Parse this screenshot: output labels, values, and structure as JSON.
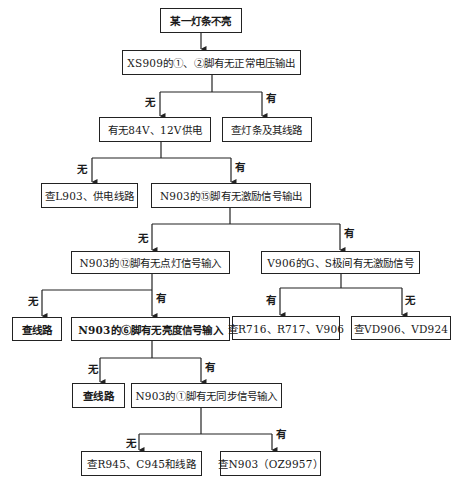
{
  "diagram": {
    "type": "flowchart",
    "nodes": [
      {
        "id": "n1",
        "text": "某一灯条不亮"
      },
      {
        "id": "n2",
        "text": "XS909的①、②脚有无正常电压输出"
      },
      {
        "id": "n3",
        "text": "有无84V、12V供电"
      },
      {
        "id": "n4",
        "text": "查灯条及其线路"
      },
      {
        "id": "n5",
        "text": "查L903、供电线路"
      },
      {
        "id": "n6",
        "text": "N903的⑮脚有无激励信号输出"
      },
      {
        "id": "n7",
        "text": "N903的⑫脚有无点灯信号输入"
      },
      {
        "id": "n8",
        "text": "V906的G、S极间有无激励信号"
      },
      {
        "id": "n9",
        "text": "查线路"
      },
      {
        "id": "n10",
        "text": "N903的⑥脚有无亮度信号输入"
      },
      {
        "id": "n11",
        "text": "查R716、R717、V906"
      },
      {
        "id": "n12",
        "text": "查VD906、VD924"
      },
      {
        "id": "n13",
        "text": "查线路"
      },
      {
        "id": "n14",
        "text": "N903的①脚有无同步信号输入"
      },
      {
        "id": "n15",
        "text": "查R945、C945和线路"
      },
      {
        "id": "n16",
        "text": "查N903（OZ9957）"
      }
    ],
    "edges": [
      {
        "from": "n1",
        "to": "n2",
        "label": ""
      },
      {
        "from": "n2",
        "to": "n3",
        "label": "无"
      },
      {
        "from": "n2",
        "to": "n4",
        "label": "有"
      },
      {
        "from": "n3",
        "to": "n5",
        "label": "无"
      },
      {
        "from": "n3",
        "to": "n6",
        "label": "有"
      },
      {
        "from": "n6",
        "to": "n7",
        "label": "无"
      },
      {
        "from": "n6",
        "to": "n8",
        "label": "有"
      },
      {
        "from": "n7",
        "to": "n9",
        "label": "无"
      },
      {
        "from": "n7",
        "to": "n10",
        "label": "有"
      },
      {
        "from": "n8",
        "to": "n11",
        "label": "有"
      },
      {
        "from": "n8",
        "to": "n12",
        "label": "无"
      },
      {
        "from": "n10",
        "to": "n13",
        "label": "无"
      },
      {
        "from": "n10",
        "to": "n14",
        "label": "有"
      },
      {
        "from": "n14",
        "to": "n15",
        "label": "无"
      },
      {
        "from": "n14",
        "to": "n16",
        "label": "有"
      }
    ]
  },
  "labels": {
    "yes": "有",
    "no": "无"
  }
}
